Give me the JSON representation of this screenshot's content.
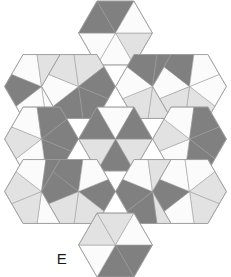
{
  "figure": {
    "label": "E",
    "background_color": "#ffffff"
  },
  "palette": {
    "white": "#fbfbfb",
    "light_gray": "#e2e2e2",
    "mid_light_gray": "#d2d2d2",
    "dark_gray": "#808080",
    "outline": "#9a9a9a",
    "gap": "#ffffff",
    "label_color": "#1a1a1a"
  },
  "geometry": {
    "hex_radius": 38.5,
    "gap": 3.2,
    "centers": [
      {
        "name": "top",
        "cx": 115.5,
        "cy": 33.0
      },
      {
        "name": "upper-left",
        "cx": 41.5,
        "cy": 86.5
      },
      {
        "name": "upper-mid-left",
        "cx": 78.5,
        "cy": 86.5
      },
      {
        "name": "upper-mid-right",
        "cx": 152.5,
        "cy": 86.5
      },
      {
        "name": "upper-right",
        "cx": 189.5,
        "cy": 86.5
      },
      {
        "name": "middle-left",
        "cx": 41.5,
        "cy": 139.0
      },
      {
        "name": "center",
        "cx": 115.5,
        "cy": 139.0
      },
      {
        "name": "middle-right",
        "cx": 189.5,
        "cy": 139.0
      },
      {
        "name": "lower-left",
        "cx": 41.5,
        "cy": 191.5
      },
      {
        "name": "lower-mid-left",
        "cx": 78.5,
        "cy": 191.5
      },
      {
        "name": "lower-mid-right",
        "cx": 152.5,
        "cy": 191.5
      },
      {
        "name": "lower-right",
        "cx": 189.5,
        "cy": 191.5
      },
      {
        "name": "bottom",
        "cx": 115.5,
        "cy": 245.0
      }
    ]
  },
  "chart_data": {
    "type": "diagram",
    "tile_count": 13,
    "shade_names": [
      "white",
      "light-gray",
      "dark-gray"
    ],
    "tiles": [
      {
        "id": "top",
        "center": [
          115.5,
          33.0
        ],
        "rotation": 0,
        "sectors": [
          "light",
          "white",
          "white",
          "dark",
          "dark",
          "white"
        ],
        "pinwheel": 0.0
      },
      {
        "id": "upper-left",
        "center": [
          41.5,
          86.5
        ],
        "rotation": 0,
        "sectors": [
          "white",
          "white",
          "dark",
          "white",
          "light",
          "light"
        ],
        "pinwheel": 0.38
      },
      {
        "id": "upper-mid-left",
        "center": [
          78.5,
          86.5
        ],
        "rotation": 0,
        "sectors": [
          "dark",
          "dark",
          "white",
          "light",
          "light",
          "dark"
        ],
        "pinwheel": 0.38
      },
      {
        "id": "upper-mid-right",
        "center": [
          152.5,
          86.5
        ],
        "rotation": 0,
        "sectors": [
          "dark",
          "light",
          "light",
          "white",
          "dark",
          "dark"
        ],
        "pinwheel": -0.38
      },
      {
        "id": "upper-right",
        "center": [
          189.5,
          86.5
        ],
        "rotation": 0,
        "sectors": [
          "white",
          "light",
          "light",
          "white",
          "dark",
          "white"
        ],
        "pinwheel": -0.38
      },
      {
        "id": "middle-left",
        "center": [
          41.5,
          139.0
        ],
        "rotation": 0,
        "sectors": [
          "dark",
          "white",
          "light",
          "white",
          "dark",
          "dark"
        ],
        "pinwheel": 0.38
      },
      {
        "id": "center",
        "center": [
          115.5,
          139.0
        ],
        "rotation": 0,
        "sectors": [
          "light",
          "dark",
          "light",
          "dark",
          "white",
          "dark"
        ],
        "pinwheel": 0.0
      },
      {
        "id": "middle-right",
        "center": [
          189.5,
          139.0
        ],
        "rotation": 0,
        "sectors": [
          "dark",
          "dark",
          "white",
          "light",
          "white",
          "dark"
        ],
        "pinwheel": -0.38
      },
      {
        "id": "lower-left",
        "center": [
          41.5,
          191.5
        ],
        "rotation": 0,
        "sectors": [
          "white",
          "white",
          "light",
          "light",
          "white",
          "dark"
        ],
        "pinwheel": -0.38
      },
      {
        "id": "lower-mid-left",
        "center": [
          78.5,
          191.5
        ],
        "rotation": 0,
        "sectors": [
          "dark",
          "light",
          "light",
          "dark",
          "dark",
          "white"
        ],
        "pinwheel": -0.38
      },
      {
        "id": "lower-mid-right",
        "center": [
          152.5,
          191.5
        ],
        "rotation": 0,
        "sectors": [
          "light",
          "dark",
          "dark",
          "white",
          "light",
          "dark"
        ],
        "pinwheel": 0.38
      },
      {
        "id": "lower-right",
        "center": [
          189.5,
          191.5
        ],
        "rotation": 0,
        "sectors": [
          "light",
          "white",
          "dark",
          "white",
          "white",
          "light"
        ],
        "pinwheel": 0.38
      },
      {
        "id": "bottom",
        "center": [
          115.5,
          245.0
        ],
        "rotation": 0,
        "sectors": [
          "dark",
          "dark",
          "white",
          "light",
          "light",
          "white"
        ],
        "pinwheel": 0.0
      }
    ]
  }
}
